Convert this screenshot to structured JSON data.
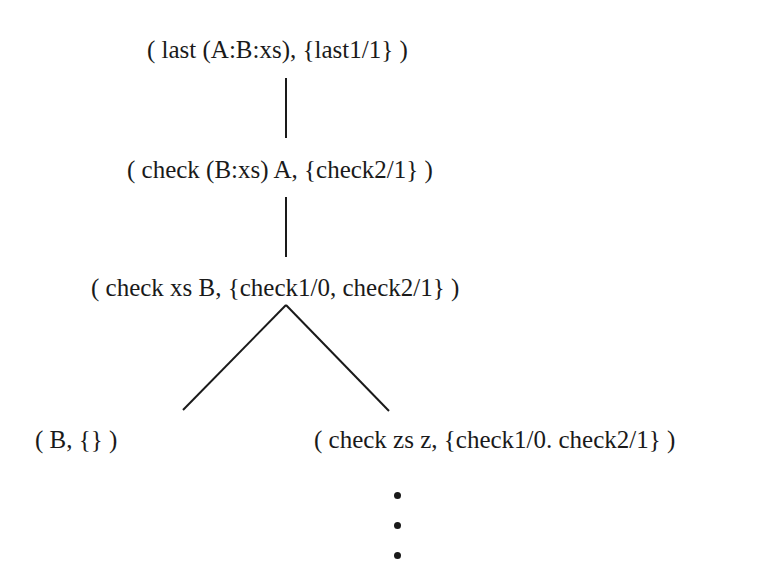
{
  "diagram": {
    "type": "derivation-tree",
    "nodes": [
      {
        "id": "n1",
        "label": "( last (A:B:xs), {last1/1} )"
      },
      {
        "id": "n2",
        "label": "( check (B:xs) A, {check2/1} )"
      },
      {
        "id": "n3",
        "label": "( check xs B, {check1/0, check2/1} )"
      },
      {
        "id": "n4",
        "label": "( B, {} )"
      },
      {
        "id": "n5",
        "label": "( check zs z, {check1/0. check2/1} )"
      }
    ],
    "edges": [
      {
        "from": "n1",
        "to": "n2"
      },
      {
        "from": "n2",
        "to": "n3"
      },
      {
        "from": "n3",
        "to": "n4"
      },
      {
        "from": "n3",
        "to": "n5"
      }
    ],
    "continuation": "vertical-ellipsis below n5",
    "colors": {
      "ink": "#1a1a1a",
      "background": "#ffffff"
    }
  }
}
